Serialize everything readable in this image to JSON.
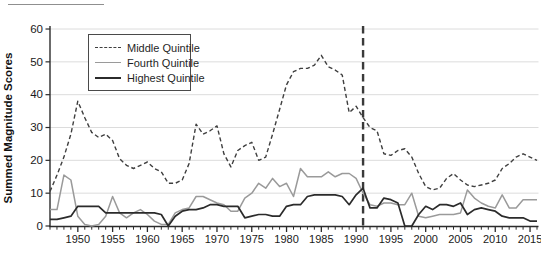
{
  "chart_data": {
    "type": "line",
    "title": "",
    "ylabel": "Summed Magnitude Scores",
    "xlabel": "",
    "ylim": [
      0,
      60
    ],
    "yticks": [
      0,
      10,
      20,
      30,
      40,
      50,
      60
    ],
    "x_range": [
      1946,
      2016
    ],
    "xtick_major": [
      1950,
      1955,
      1960,
      1965,
      1970,
      1975,
      1980,
      1985,
      1990,
      1995,
      2000,
      2005,
      2010,
      2015
    ],
    "grid": true,
    "legend_position": "top-left",
    "vline": {
      "x": 1991,
      "style": "dashed",
      "color": "#3a3a3a"
    },
    "colors": {
      "grid": "#dcdcdc",
      "axis": "#2b2b2b",
      "tick_text": "#1a1a1a"
    },
    "x": [
      1946,
      1947,
      1948,
      1949,
      1950,
      1951,
      1952,
      1953,
      1954,
      1955,
      1956,
      1957,
      1958,
      1959,
      1960,
      1961,
      1962,
      1963,
      1964,
      1965,
      1966,
      1967,
      1968,
      1969,
      1970,
      1971,
      1972,
      1973,
      1974,
      1975,
      1976,
      1977,
      1978,
      1979,
      1980,
      1981,
      1982,
      1983,
      1984,
      1985,
      1986,
      1987,
      1988,
      1989,
      1990,
      1991,
      1992,
      1993,
      1994,
      1995,
      1996,
      1997,
      1998,
      1999,
      2000,
      2001,
      2002,
      2003,
      2004,
      2005,
      2006,
      2007,
      2008,
      2009,
      2010,
      2011,
      2012,
      2013,
      2014,
      2015,
      2016
    ],
    "series": [
      {
        "name": "Middle Quintile",
        "style": "dashed",
        "color": "#3f3f3f",
        "width": 1.4,
        "values": [
          10.5,
          15.5,
          21,
          28,
          38,
          33,
          28.5,
          27,
          28,
          26,
          20.5,
          18.5,
          17.5,
          18.5,
          19.5,
          17.5,
          16.5,
          13,
          13,
          14,
          19,
          31,
          28,
          29,
          30.5,
          22,
          18,
          23,
          24.5,
          25.5,
          20,
          21,
          28,
          35.5,
          43,
          47,
          48,
          48,
          49,
          52,
          48.5,
          47.5,
          46,
          34.5,
          36.5,
          33,
          30,
          29,
          22,
          21.5,
          23,
          23.5,
          21,
          16,
          12,
          11,
          11.5,
          14.5,
          16,
          14,
          12.5,
          12,
          12.5,
          13,
          14,
          17.5,
          19,
          21,
          22,
          21,
          20
        ]
      },
      {
        "name": "Fourth Quintile",
        "style": "solid",
        "color": "#9a9a9a",
        "width": 1.5,
        "values": [
          5,
          5,
          15.5,
          14,
          3,
          0.5,
          0,
          0.5,
          3,
          9,
          4,
          2.5,
          4,
          5,
          3.5,
          1.5,
          0.5,
          0.5,
          4,
          5,
          5.5,
          9,
          9,
          8,
          7,
          6.5,
          4.5,
          4.5,
          8.5,
          10,
          13,
          11.5,
          14.5,
          12,
          13,
          9,
          17.5,
          15,
          15,
          15,
          16.5,
          15,
          16,
          16,
          14.5,
          10,
          6.5,
          6,
          7,
          7,
          6.5,
          6.5,
          10,
          3,
          2.5,
          3,
          3.5,
          3.5,
          3.5,
          4,
          11,
          8.5,
          7,
          6,
          5.5,
          9.5,
          5.5,
          5.5,
          8,
          8,
          8
        ]
      },
      {
        "name": "Highest Quintile",
        "style": "solid",
        "color": "#2b2b2b",
        "width": 1.7,
        "values": [
          2,
          2,
          2.5,
          3,
          6,
          6,
          6,
          6,
          4,
          4,
          4,
          4,
          4,
          4,
          4,
          4,
          3.5,
          0,
          3,
          4.5,
          5,
          5,
          5.5,
          6.5,
          6.5,
          6,
          6,
          6,
          2.5,
          3,
          3.5,
          3.5,
          3,
          3,
          6,
          6.5,
          6.5,
          9,
          9.5,
          9.5,
          9.5,
          9.5,
          9,
          6.5,
          9.5,
          11.5,
          5.5,
          5.5,
          8.5,
          8,
          7,
          0,
          0,
          3.5,
          6,
          5,
          6.5,
          6.5,
          6,
          7,
          3.5,
          5,
          5.5,
          5,
          4.5,
          3,
          2.5,
          2.5,
          2.5,
          1.5,
          1.5
        ]
      }
    ]
  }
}
